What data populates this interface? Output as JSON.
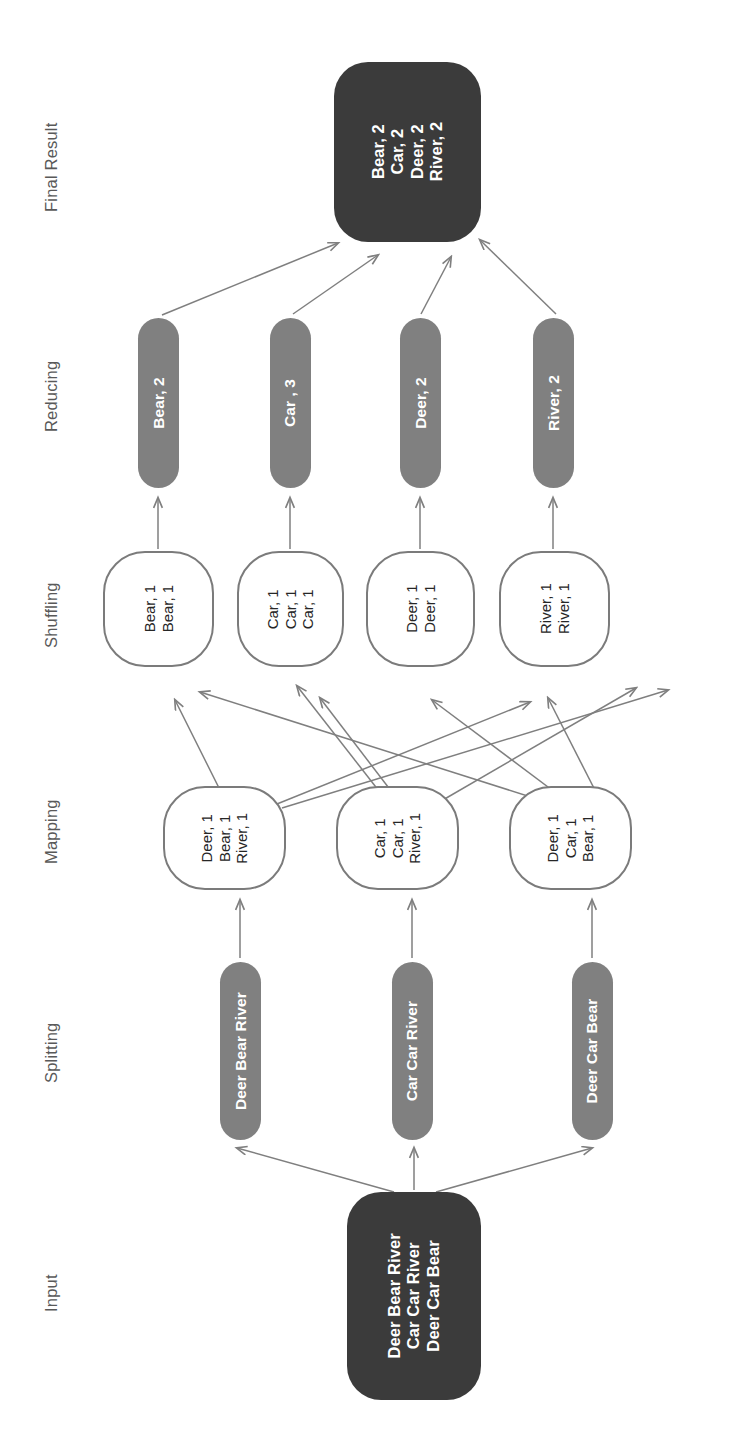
{
  "diagram": {
    "type": "flow-diagram",
    "orientation": "bottom-to-top, text rotated 90 degrees counter-clockwise",
    "colors": {
      "dark_node_fill": "#3b3b3b",
      "gray_node_fill": "#808080",
      "outline_node_border": "#7b7b7b",
      "outline_node_fill": "#ffffff",
      "arrow": "#7f7f7f",
      "stage_label_text": "#595959",
      "dark_node_text": "#ffffff",
      "outline_node_text": "#262626",
      "background": "#ffffff"
    }
  },
  "stage_labels": {
    "final_result": "Final Result",
    "reducing": "Reducing",
    "shuffling": "Shuffling",
    "mapping": "Mapping",
    "splitting": "Splitting",
    "input": "Input"
  },
  "final_result": {
    "lines": [
      "Bear, 2",
      "Car, 2",
      "Deer, 2",
      "River, 2"
    ],
    "text": "Bear, 2\nCar, 2\nDeer, 2\nRiver, 2"
  },
  "reducing": {
    "nodes": [
      {
        "text": "Bear, 2"
      },
      {
        "text": "Car , 3"
      },
      {
        "text": "Deer, 2"
      },
      {
        "text": "River, 2"
      }
    ]
  },
  "shuffling": {
    "nodes": [
      {
        "lines": [
          "Bear, 1",
          "Bear, 1"
        ],
        "text": "Bear, 1\nBear, 1"
      },
      {
        "lines": [
          "Car, 1",
          "Car, 1",
          "Car, 1"
        ],
        "text": "Car, 1\nCar, 1\nCar, 1"
      },
      {
        "lines": [
          "Deer, 1",
          "Deer, 1"
        ],
        "text": "Deer, 1\nDeer, 1"
      },
      {
        "lines": [
          "River, 1",
          "River, 1"
        ],
        "text": "River, 1\nRiver, 1"
      }
    ]
  },
  "mapping": {
    "nodes": [
      {
        "lines": [
          "Deer, 1",
          "Bear, 1",
          "River, 1"
        ],
        "text": "Deer, 1\nBear, 1\nRiver, 1"
      },
      {
        "lines": [
          "Car, 1",
          "Car, 1",
          "River, 1"
        ],
        "text": "Car, 1\nCar, 1\nRiver, 1"
      },
      {
        "lines": [
          "Deer, 1",
          "Car, 1",
          "Bear, 1"
        ],
        "text": "Deer, 1\nCar, 1\nBear, 1"
      }
    ]
  },
  "splitting": {
    "nodes": [
      {
        "text": "Deer Bear River"
      },
      {
        "text": "Car Car River"
      },
      {
        "text": "Deer Car Bear"
      }
    ]
  },
  "input": {
    "lines": [
      "Deer Bear River",
      "Car Car River",
      "Deer Car Bear"
    ],
    "text": "Deer Bear River\nCar Car River\nDeer Car Bear"
  }
}
